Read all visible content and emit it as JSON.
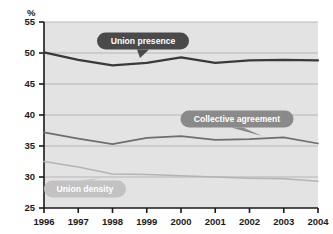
{
  "chart_data": {
    "type": "line",
    "title": "",
    "subtitle": "",
    "xlabel": "",
    "ylabel": "%",
    "unit_label": "%",
    "categories": [
      "1996",
      "1997",
      "1998",
      "1999",
      "2000",
      "2001",
      "2002",
      "2003",
      "2004"
    ],
    "x": [
      1996,
      1997,
      1998,
      1999,
      2000,
      2001,
      2002,
      2003,
      2004
    ],
    "xlim": [
      1996,
      2004
    ],
    "ylim": [
      25,
      55
    ],
    "yticks": [
      25,
      30,
      35,
      40,
      45,
      50,
      55
    ],
    "xticks": [
      "1996",
      "1997",
      "1998",
      "1999",
      "2000",
      "2001",
      "2002",
      "2003",
      "2004"
    ],
    "grid": true,
    "legend": "inline-callouts",
    "series": [
      {
        "name": "Union presence",
        "color": "#3a3a3a",
        "values": [
          50.1,
          48.9,
          48.0,
          48.4,
          49.3,
          48.4,
          48.8,
          48.9,
          48.8
        ]
      },
      {
        "name": "Collective agreement",
        "color": "#6e6e6e",
        "values": [
          37.2,
          36.2,
          35.3,
          36.3,
          36.6,
          36.0,
          36.1,
          36.4,
          35.4
        ]
      },
      {
        "name": "Union density",
        "color": "#b4b4b4",
        "values": [
          32.5,
          31.6,
          30.5,
          30.4,
          30.2,
          30.0,
          29.8,
          29.7,
          29.3
        ]
      }
    ],
    "annotations": [
      {
        "text": "Union presence",
        "style": "dark",
        "fill": "#4a4a4a",
        "text_color": "#ffffff"
      },
      {
        "text": "Collective agreement",
        "style": "mid",
        "fill": "#8a8a8a",
        "text_color": "#ffffff"
      },
      {
        "text": "Union density",
        "style": "light",
        "fill": "#c2c2c2",
        "text_color": "#ffffff"
      }
    ],
    "colors": {
      "plot_background": "#e3e3e3",
      "page_background": "#ffffff",
      "axis": "#1a1a1a",
      "gridline": "#b0b0b0"
    }
  }
}
